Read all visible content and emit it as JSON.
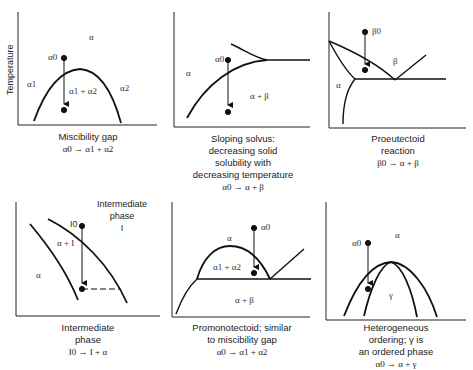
{
  "figure": {
    "y_axis_label": "Temperature",
    "panels": [
      {
        "id": "miscibility-gap",
        "caption": "Miscibility gap",
        "reaction": "α0 → α1 + α2",
        "labels": {
          "top": "α",
          "start": "α0",
          "left": "α1",
          "inside": "α1 + α2",
          "right": "α2"
        }
      },
      {
        "id": "sloping-solvus",
        "caption_lines": [
          "Sloping solvus:",
          "decreasing solid",
          "solubility with",
          "decreasing temperature"
        ],
        "reaction": "α0 → α + β",
        "labels": {
          "start": "α0",
          "left": "α",
          "inside": "α + β"
        }
      },
      {
        "id": "proeutectoid",
        "caption_lines": [
          "Proeutectoid",
          "reaction"
        ],
        "reaction": "β0 → α + β",
        "labels": {
          "start": "β0",
          "beta": "β",
          "alpha": "α"
        }
      },
      {
        "id": "intermediate-phase",
        "caption_lines": [
          "Intermediate",
          "phase"
        ],
        "reaction": "I0 → I + α",
        "labels": {
          "start": "I0",
          "inside": "α + I",
          "alpha": "α",
          "phase_title_lines": [
            "Intermediate",
            "phase",
            "I"
          ]
        }
      },
      {
        "id": "promonotectoid",
        "caption_lines": [
          "Promonotectoid; similar",
          "to miscibility gap"
        ],
        "reaction": "α0 → α1 + α2",
        "labels": {
          "start": "α0",
          "top": "α",
          "inside": "α1 + α2",
          "bottom": "α + β"
        }
      },
      {
        "id": "heterogeneous-ordering",
        "caption_lines": [
          "Heterogeneous",
          "ordering; γ is",
          "an ordered phase"
        ],
        "reaction": "α0 → α + γ",
        "labels": {
          "start": "α0",
          "top": "α",
          "inside": "γ"
        }
      }
    ]
  }
}
